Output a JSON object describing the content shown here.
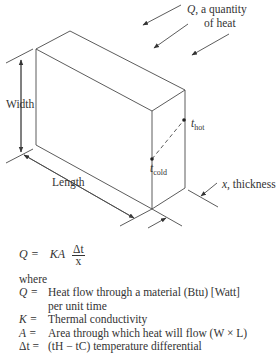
{
  "figure": {
    "heat_label_line1": "Q, a quantity",
    "heat_label_line2": "of heat",
    "width_label": "Width",
    "length_label": "Length",
    "thickness_label": "x, thickness",
    "t_hot": {
      "base": "t",
      "sub": "hot"
    },
    "t_cold": {
      "base": "t",
      "sub": "cold"
    }
  },
  "equation": {
    "lhs": "Q =",
    "rhs": "KA",
    "numerator": "Δt",
    "denominator": "x"
  },
  "where_label": "where",
  "definitions": [
    {
      "symbol": "Q =",
      "text": "Heat flow through a material (Btu) [Watt]",
      "continuation": "per unit time"
    },
    {
      "symbol": "K =",
      "text": "Thermal conductivity"
    },
    {
      "symbol": "A =",
      "text": "Area through which heat will flow (W × L)"
    },
    {
      "symbol": "Δt =",
      "text": "(tH − tC) temperature differential"
    }
  ]
}
